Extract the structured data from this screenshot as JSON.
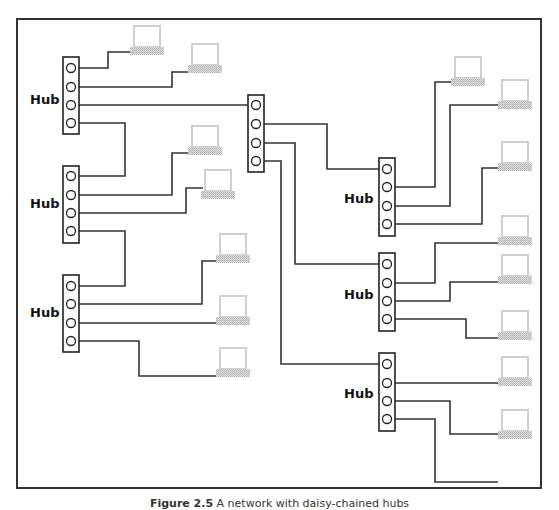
{
  "diagram": {
    "type": "network-topology",
    "hub_label": "Hub",
    "caption": {
      "label": "Figure 2.5",
      "text": "A network with daisy-chained hubs"
    },
    "colors": {
      "line": "#333333",
      "hub_outline": "#222222",
      "computer_outline": "#c8c8c8",
      "computer_base": "#bdbdbd",
      "frame": "#333333"
    },
    "central_hub": {
      "id": "hub-central",
      "ports": 4,
      "labeled": false
    },
    "hubs": [
      {
        "id": "hub-left-1",
        "label": "Hub",
        "ports": 4
      },
      {
        "id": "hub-left-2",
        "label": "Hub",
        "ports": 4
      },
      {
        "id": "hub-left-3",
        "label": "Hub",
        "ports": 4
      },
      {
        "id": "hub-right-1",
        "label": "Hub",
        "ports": 4
      },
      {
        "id": "hub-right-2",
        "label": "Hub",
        "ports": 4
      },
      {
        "id": "hub-right-3",
        "label": "Hub",
        "ports": 4
      }
    ],
    "computer_count": 15
  }
}
